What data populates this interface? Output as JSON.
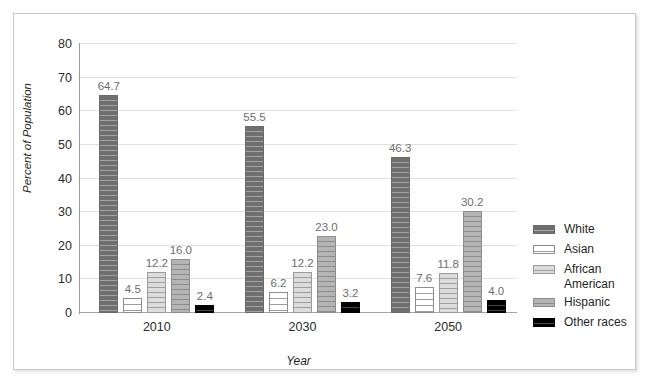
{
  "chart_data": {
    "type": "bar",
    "title": "",
    "subtitle": "",
    "xlabel": "Year",
    "ylabel": "Percent of Population",
    "categories": [
      "2010",
      "2030",
      "2050"
    ],
    "ylim": [
      0,
      80
    ],
    "yticks": [
      0,
      10,
      20,
      30,
      40,
      50,
      60,
      70,
      80
    ],
    "ytick_labels": [
      "0",
      "10",
      "20",
      "30",
      "40",
      "50",
      "60",
      "70",
      "80"
    ],
    "grid": true,
    "legend_position": "right",
    "series": [
      {
        "name": "White",
        "color": "#7b7b7b",
        "pattern": "horizontal-stripes-dark",
        "values": [
          64.7,
          55.5,
          46.3
        ],
        "labels": [
          "64.7",
          "55.5",
          "46.3"
        ]
      },
      {
        "name": "Asian",
        "color": "#ffffff",
        "pattern": "horizontal-stripes-white",
        "values": [
          4.5,
          6.2,
          7.6
        ],
        "labels": [
          "4.5",
          "6.2",
          "7.6"
        ]
      },
      {
        "name": "African American",
        "color": "#d9d9d9",
        "pattern": "horizontal-stripes-light",
        "values": [
          12.2,
          12.2,
          11.8
        ],
        "labels": [
          "12.2",
          "12.2",
          "11.8"
        ]
      },
      {
        "name": "Hispanic",
        "color": "#b3b3b3",
        "pattern": "horizontal-stripes-medium",
        "values": [
          16.0,
          23.0,
          30.2
        ],
        "labels": [
          "16.0",
          "23.0",
          "30.2"
        ]
      },
      {
        "name": "Other races",
        "color": "#111111",
        "pattern": "horizontal-stripes-black",
        "values": [
          2.4,
          3.2,
          4.0
        ],
        "labels": [
          "2.4",
          "3.2",
          "4.0"
        ]
      }
    ]
  },
  "legend": {
    "items": [
      {
        "label": "White",
        "swatch": "white-cat"
      },
      {
        "label": "Asian",
        "swatch": "asian"
      },
      {
        "label": "African American",
        "swatch": "african"
      },
      {
        "label": "Hispanic",
        "swatch": "hispanic"
      },
      {
        "label": "Other races",
        "swatch": "other"
      }
    ]
  }
}
